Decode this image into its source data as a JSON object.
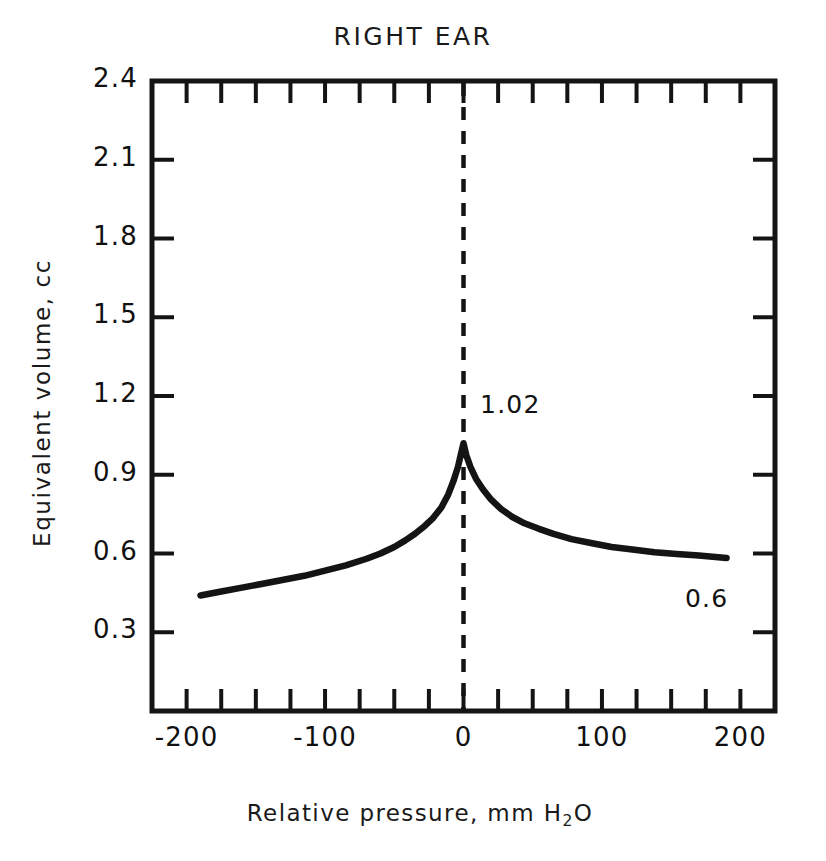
{
  "chart_data": {
    "type": "line",
    "title": "RIGHT EAR",
    "xlabel": "Relative pressure, mm H",
    "xlabel_sub": "2",
    "xlabel_tail": "O",
    "xlabel_full": "Relative pressure, mm H2O",
    "ylabel": "Equivalent volume, cc",
    "xlim": [
      -225,
      225
    ],
    "ylim": [
      0,
      2.4
    ],
    "grid": false,
    "legend": null,
    "x_ticks_major": [
      -200,
      -100,
      0,
      100,
      200
    ],
    "x_tick_labels": [
      "-200",
      "-100",
      "0",
      "100",
      "200"
    ],
    "x_ticks_minor": [
      -225,
      -175,
      -150,
      -125,
      -75,
      -50,
      -25,
      25,
      50,
      75,
      125,
      150,
      175,
      225
    ],
    "x_tick_interval": 25,
    "y_ticks": [
      0.3,
      0.6,
      0.9,
      1.2,
      1.5,
      1.8,
      2.1,
      2.4
    ],
    "y_tick_labels": [
      "0.3",
      "0.6",
      "0.9",
      "1.2",
      "1.5",
      "1.8",
      "2.1",
      "2.4"
    ],
    "series": [
      {
        "name": "tympanogram",
        "color": "#141414",
        "x": [
          -190,
          -175,
          -160,
          -145,
          -130,
          -115,
          -100,
          -85,
          -70,
          -60,
          -50,
          -42,
          -35,
          -28,
          -22,
          -16,
          -11,
          -7,
          -4,
          -2,
          0,
          2,
          5,
          9,
          14,
          20,
          27,
          35,
          44,
          54,
          65,
          78,
          92,
          107,
          122,
          138,
          154,
          170,
          190
        ],
        "y": [
          0.44,
          0.455,
          0.47,
          0.485,
          0.5,
          0.515,
          0.535,
          0.555,
          0.58,
          0.6,
          0.625,
          0.65,
          0.675,
          0.705,
          0.735,
          0.775,
          0.825,
          0.88,
          0.93,
          0.975,
          1.02,
          0.975,
          0.93,
          0.885,
          0.845,
          0.805,
          0.77,
          0.74,
          0.715,
          0.695,
          0.675,
          0.655,
          0.64,
          0.625,
          0.615,
          0.605,
          0.598,
          0.592,
          0.583
        ]
      }
    ],
    "annotations": [
      {
        "name": "peak-value",
        "text": "1.02",
        "x": 12,
        "y": 1.16
      },
      {
        "name": "tail-value",
        "text": "0.6",
        "x": 160,
        "y": 0.42
      }
    ],
    "reference_line": {
      "name": "zero-pressure-line",
      "x": 0,
      "style": "dashed",
      "color": "#141414"
    }
  }
}
